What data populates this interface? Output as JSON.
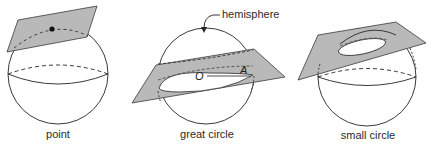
{
  "figure": {
    "colors": {
      "plane_fill": "#b9b9b9",
      "stroke": "#3a3a3a",
      "background": "#ffffff"
    },
    "panels": [
      {
        "id": "point",
        "caption": "point",
        "description": "Plane tangent to sphere at a single point"
      },
      {
        "id": "great_circle",
        "caption": "great circle",
        "description": "Plane through sphere center cuts a great circle",
        "callout": "hemisphere",
        "center_label": "O",
        "radius_point_label": "A"
      },
      {
        "id": "small_circle",
        "caption": "small circle",
        "description": "Plane not through center cuts a small circle"
      }
    ]
  }
}
